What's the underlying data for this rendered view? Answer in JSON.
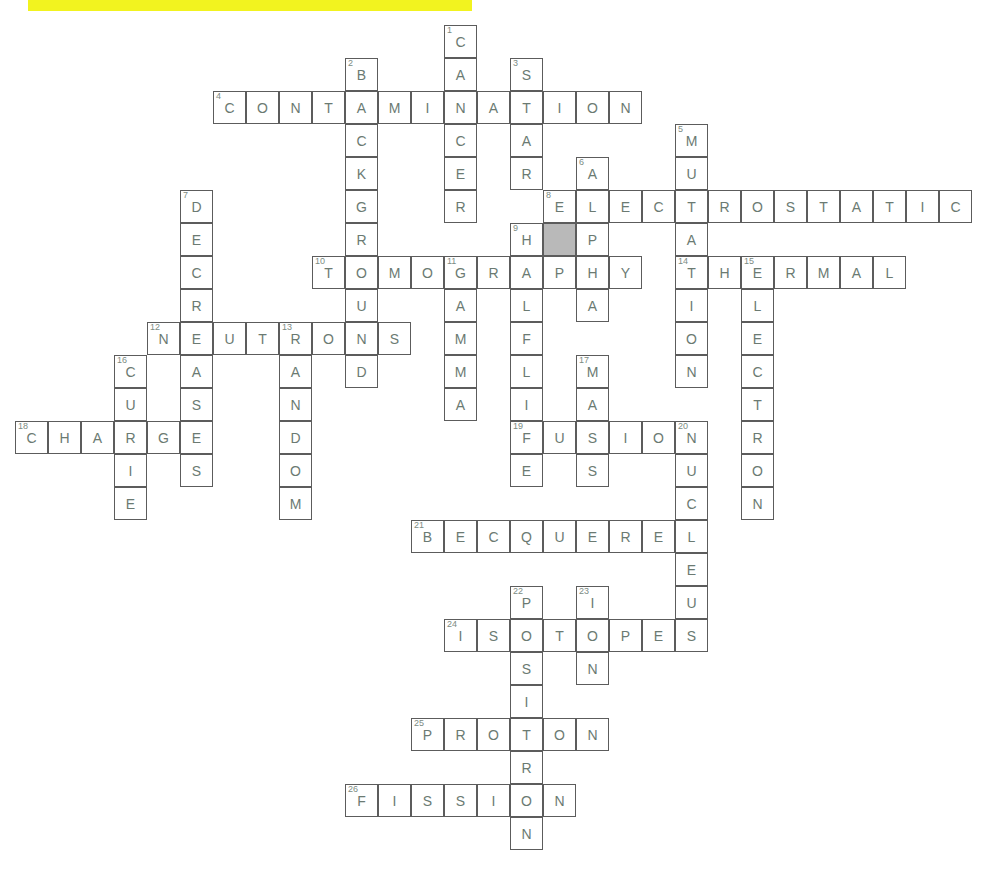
{
  "page": {
    "width": 984,
    "height": 882
  },
  "highlight": {
    "name": "yellow-highlight-bar",
    "color": "#f2f31f",
    "x": 28,
    "y": 0,
    "width": 444,
    "height": 11
  },
  "grid": {
    "cell_size": 33,
    "origin_x": 15,
    "origin_y": 25,
    "border_color": "#5c5c5c",
    "letter_color": "#6b7a72",
    "clue_number_color": "#7c8b83",
    "shaded_cell_color": "#b9b9b9",
    "background_color": "#ffffff"
  },
  "chart_data": {
    "type": "table",
    "across_entries": [
      {
        "number": 4,
        "answer": "CONTAMINATION",
        "row": 2,
        "col": 6,
        "length": 13
      },
      {
        "number": 8,
        "answer": "ELECTROSTATIC",
        "row": 5,
        "col": 16,
        "length": 13
      },
      {
        "number": 10,
        "answer": "TOMOGRAPHY",
        "row": 7,
        "col": 9,
        "length": 10
      },
      {
        "number": 14,
        "answer": "THERMAL",
        "row": 7,
        "col": 20,
        "length": 7
      },
      {
        "number": 12,
        "answer": "NEUTRONS",
        "row": 9,
        "col": 4,
        "length": 8
      },
      {
        "number": 18,
        "answer": "CHARGE",
        "row": 12,
        "col": 0,
        "length": 6
      },
      {
        "number": 19,
        "answer": "FUSION",
        "row": 12,
        "col": 15,
        "length": 6
      },
      {
        "number": 21,
        "answer": "BECQUEREL",
        "row": 15,
        "col": 12,
        "length": 9
      },
      {
        "number": 24,
        "answer": "ISOTOPES",
        "row": 18,
        "col": 13,
        "length": 8
      },
      {
        "number": 25,
        "answer": "PROTON",
        "row": 21,
        "col": 12,
        "length": 6
      },
      {
        "number": 26,
        "answer": "FISSION",
        "row": 23,
        "col": 10,
        "length": 7
      }
    ],
    "down_entries": [
      {
        "number": 1,
        "answer": "CANCER",
        "row": 0,
        "col": 13,
        "length": 6
      },
      {
        "number": 2,
        "answer": "BACKGROUND",
        "row": 1,
        "col": 10,
        "length": 10
      },
      {
        "number": 3,
        "answer": "STAR",
        "row": 1,
        "col": 15,
        "length": 4
      },
      {
        "number": 5,
        "answer": "MUTATION",
        "row": 3,
        "col": 20,
        "length": 8
      },
      {
        "number": 6,
        "answer": "ALPHA",
        "row": 4,
        "col": 17,
        "length": 5
      },
      {
        "number": 7,
        "answer": "DECREASES",
        "row": 5,
        "col": 5,
        "length": 9
      },
      {
        "number": 9,
        "answer": "HALFLIFE",
        "row": 6,
        "col": 15,
        "length": 8
      },
      {
        "number": 11,
        "answer": "GAMMA",
        "row": 7,
        "col": 13,
        "length": 5
      },
      {
        "number": 13,
        "answer": "RANDOM",
        "row": 9,
        "col": 8,
        "length": 6
      },
      {
        "number": 15,
        "answer": "ELECTRON",
        "row": 7,
        "col": 22,
        "length": 8
      },
      {
        "number": 16,
        "answer": "CURIE",
        "row": 10,
        "col": 3,
        "length": 5
      },
      {
        "number": 17,
        "answer": "MASS",
        "row": 10,
        "col": 17,
        "length": 4
      },
      {
        "number": 20,
        "answer": "NUCLEUS",
        "row": 12,
        "col": 20,
        "length": 7
      },
      {
        "number": 22,
        "answer": "POSITRON",
        "row": 17,
        "col": 15,
        "length": 8
      },
      {
        "number": 23,
        "answer": "ION",
        "row": 17,
        "col": 17,
        "length": 3
      }
    ],
    "cells": [
      {
        "row": 0,
        "col": 13,
        "letter": "C",
        "num": "1"
      },
      {
        "row": 1,
        "col": 10,
        "letter": "B",
        "num": "2"
      },
      {
        "row": 1,
        "col": 13,
        "letter": "A",
        "num": ""
      },
      {
        "row": 1,
        "col": 15,
        "letter": "S",
        "num": "3"
      },
      {
        "row": 2,
        "col": 6,
        "letter": "C",
        "num": "4"
      },
      {
        "row": 2,
        "col": 7,
        "letter": "O",
        "num": ""
      },
      {
        "row": 2,
        "col": 8,
        "letter": "N",
        "num": ""
      },
      {
        "row": 2,
        "col": 9,
        "letter": "T",
        "num": ""
      },
      {
        "row": 2,
        "col": 10,
        "letter": "A",
        "num": ""
      },
      {
        "row": 2,
        "col": 11,
        "letter": "M",
        "num": ""
      },
      {
        "row": 2,
        "col": 12,
        "letter": "I",
        "num": ""
      },
      {
        "row": 2,
        "col": 13,
        "letter": "N",
        "num": ""
      },
      {
        "row": 2,
        "col": 14,
        "letter": "A",
        "num": ""
      },
      {
        "row": 2,
        "col": 15,
        "letter": "T",
        "num": ""
      },
      {
        "row": 2,
        "col": 16,
        "letter": "I",
        "num": ""
      },
      {
        "row": 2,
        "col": 17,
        "letter": "O",
        "num": ""
      },
      {
        "row": 2,
        "col": 18,
        "letter": "N",
        "num": ""
      },
      {
        "row": 3,
        "col": 10,
        "letter": "C",
        "num": ""
      },
      {
        "row": 3,
        "col": 13,
        "letter": "C",
        "num": ""
      },
      {
        "row": 3,
        "col": 15,
        "letter": "A",
        "num": ""
      },
      {
        "row": 3,
        "col": 20,
        "letter": "M",
        "num": "5"
      },
      {
        "row": 4,
        "col": 10,
        "letter": "K",
        "num": ""
      },
      {
        "row": 4,
        "col": 13,
        "letter": "E",
        "num": ""
      },
      {
        "row": 4,
        "col": 15,
        "letter": "R",
        "num": ""
      },
      {
        "row": 4,
        "col": 17,
        "letter": "A",
        "num": "6"
      },
      {
        "row": 4,
        "col": 20,
        "letter": "U",
        "num": ""
      },
      {
        "row": 5,
        "col": 5,
        "letter": "D",
        "num": "7"
      },
      {
        "row": 5,
        "col": 10,
        "letter": "G",
        "num": ""
      },
      {
        "row": 5,
        "col": 13,
        "letter": "R",
        "num": ""
      },
      {
        "row": 5,
        "col": 16,
        "letter": "E",
        "num": "8"
      },
      {
        "row": 5,
        "col": 17,
        "letter": "L",
        "num": ""
      },
      {
        "row": 5,
        "col": 18,
        "letter": "E",
        "num": ""
      },
      {
        "row": 5,
        "col": 19,
        "letter": "C",
        "num": ""
      },
      {
        "row": 5,
        "col": 20,
        "letter": "T",
        "num": ""
      },
      {
        "row": 5,
        "col": 21,
        "letter": "R",
        "num": ""
      },
      {
        "row": 5,
        "col": 22,
        "letter": "O",
        "num": ""
      },
      {
        "row": 5,
        "col": 23,
        "letter": "S",
        "num": ""
      },
      {
        "row": 5,
        "col": 24,
        "letter": "T",
        "num": ""
      },
      {
        "row": 5,
        "col": 25,
        "letter": "A",
        "num": ""
      },
      {
        "row": 5,
        "col": 26,
        "letter": "T",
        "num": ""
      },
      {
        "row": 5,
        "col": 27,
        "letter": "I",
        "num": ""
      },
      {
        "row": 5,
        "col": 28,
        "letter": "C",
        "num": ""
      },
      {
        "row": 6,
        "col": 5,
        "letter": "E",
        "num": ""
      },
      {
        "row": 6,
        "col": 10,
        "letter": "R",
        "num": ""
      },
      {
        "row": 6,
        "col": 15,
        "letter": "H",
        "num": "9"
      },
      {
        "row": 6,
        "col": 16,
        "letter": "",
        "num": "",
        "shaded": true
      },
      {
        "row": 6,
        "col": 17,
        "letter": "P",
        "num": ""
      },
      {
        "row": 6,
        "col": 20,
        "letter": "A",
        "num": ""
      },
      {
        "row": 7,
        "col": 5,
        "letter": "C",
        "num": ""
      },
      {
        "row": 7,
        "col": 9,
        "letter": "T",
        "num": "10"
      },
      {
        "row": 7,
        "col": 10,
        "letter": "O",
        "num": ""
      },
      {
        "row": 7,
        "col": 11,
        "letter": "M",
        "num": ""
      },
      {
        "row": 7,
        "col": 12,
        "letter": "O",
        "num": ""
      },
      {
        "row": 7,
        "col": 13,
        "letter": "G",
        "num": "11"
      },
      {
        "row": 7,
        "col": 14,
        "letter": "R",
        "num": ""
      },
      {
        "row": 7,
        "col": 15,
        "letter": "A",
        "num": ""
      },
      {
        "row": 7,
        "col": 16,
        "letter": "P",
        "num": ""
      },
      {
        "row": 7,
        "col": 17,
        "letter": "H",
        "num": ""
      },
      {
        "row": 7,
        "col": 18,
        "letter": "Y",
        "num": ""
      },
      {
        "row": 7,
        "col": 20,
        "letter": "T",
        "num": "14"
      },
      {
        "row": 7,
        "col": 21,
        "letter": "H",
        "num": ""
      },
      {
        "row": 7,
        "col": 22,
        "letter": "E",
        "num": "15"
      },
      {
        "row": 7,
        "col": 23,
        "letter": "R",
        "num": ""
      },
      {
        "row": 7,
        "col": 24,
        "letter": "M",
        "num": ""
      },
      {
        "row": 7,
        "col": 25,
        "letter": "A",
        "num": ""
      },
      {
        "row": 7,
        "col": 26,
        "letter": "L",
        "num": ""
      },
      {
        "row": 8,
        "col": 5,
        "letter": "R",
        "num": ""
      },
      {
        "row": 8,
        "col": 10,
        "letter": "U",
        "num": ""
      },
      {
        "row": 8,
        "col": 13,
        "letter": "A",
        "num": ""
      },
      {
        "row": 8,
        "col": 15,
        "letter": "L",
        "num": ""
      },
      {
        "row": 8,
        "col": 17,
        "letter": "A",
        "num": ""
      },
      {
        "row": 8,
        "col": 20,
        "letter": "I",
        "num": ""
      },
      {
        "row": 8,
        "col": 22,
        "letter": "L",
        "num": ""
      },
      {
        "row": 9,
        "col": 4,
        "letter": "N",
        "num": "12"
      },
      {
        "row": 9,
        "col": 5,
        "letter": "E",
        "num": ""
      },
      {
        "row": 9,
        "col": 6,
        "letter": "U",
        "num": ""
      },
      {
        "row": 9,
        "col": 7,
        "letter": "T",
        "num": ""
      },
      {
        "row": 9,
        "col": 8,
        "letter": "R",
        "num": "13"
      },
      {
        "row": 9,
        "col": 9,
        "letter": "O",
        "num": ""
      },
      {
        "row": 9,
        "col": 10,
        "letter": "N",
        "num": ""
      },
      {
        "row": 9,
        "col": 11,
        "letter": "S",
        "num": ""
      },
      {
        "row": 9,
        "col": 13,
        "letter": "M",
        "num": ""
      },
      {
        "row": 9,
        "col": 15,
        "letter": "F",
        "num": ""
      },
      {
        "row": 9,
        "col": 20,
        "letter": "O",
        "num": ""
      },
      {
        "row": 9,
        "col": 22,
        "letter": "E",
        "num": ""
      },
      {
        "row": 10,
        "col": 3,
        "letter": "C",
        "num": "16"
      },
      {
        "row": 10,
        "col": 5,
        "letter": "A",
        "num": ""
      },
      {
        "row": 10,
        "col": 8,
        "letter": "A",
        "num": ""
      },
      {
        "row": 10,
        "col": 10,
        "letter": "D",
        "num": ""
      },
      {
        "row": 10,
        "col": 13,
        "letter": "M",
        "num": ""
      },
      {
        "row": 10,
        "col": 15,
        "letter": "L",
        "num": ""
      },
      {
        "row": 10,
        "col": 17,
        "letter": "M",
        "num": "17"
      },
      {
        "row": 10,
        "col": 20,
        "letter": "N",
        "num": ""
      },
      {
        "row": 10,
        "col": 22,
        "letter": "C",
        "num": ""
      },
      {
        "row": 11,
        "col": 3,
        "letter": "U",
        "num": ""
      },
      {
        "row": 11,
        "col": 5,
        "letter": "S",
        "num": ""
      },
      {
        "row": 11,
        "col": 8,
        "letter": "N",
        "num": ""
      },
      {
        "row": 11,
        "col": 13,
        "letter": "A",
        "num": ""
      },
      {
        "row": 11,
        "col": 15,
        "letter": "I",
        "num": ""
      },
      {
        "row": 11,
        "col": 17,
        "letter": "A",
        "num": ""
      },
      {
        "row": 11,
        "col": 22,
        "letter": "T",
        "num": ""
      },
      {
        "row": 12,
        "col": 0,
        "letter": "C",
        "num": "18"
      },
      {
        "row": 12,
        "col": 1,
        "letter": "H",
        "num": ""
      },
      {
        "row": 12,
        "col": 2,
        "letter": "A",
        "num": ""
      },
      {
        "row": 12,
        "col": 3,
        "letter": "R",
        "num": ""
      },
      {
        "row": 12,
        "col": 4,
        "letter": "G",
        "num": ""
      },
      {
        "row": 12,
        "col": 5,
        "letter": "E",
        "num": ""
      },
      {
        "row": 12,
        "col": 8,
        "letter": "D",
        "num": ""
      },
      {
        "row": 12,
        "col": 15,
        "letter": "F",
        "num": "19"
      },
      {
        "row": 12,
        "col": 16,
        "letter": "U",
        "num": ""
      },
      {
        "row": 12,
        "col": 17,
        "letter": "S",
        "num": ""
      },
      {
        "row": 12,
        "col": 18,
        "letter": "I",
        "num": ""
      },
      {
        "row": 12,
        "col": 19,
        "letter": "O",
        "num": ""
      },
      {
        "row": 12,
        "col": 20,
        "letter": "N",
        "num": "20"
      },
      {
        "row": 12,
        "col": 22,
        "letter": "R",
        "num": ""
      },
      {
        "row": 13,
        "col": 3,
        "letter": "I",
        "num": ""
      },
      {
        "row": 13,
        "col": 5,
        "letter": "S",
        "num": ""
      },
      {
        "row": 13,
        "col": 8,
        "letter": "O",
        "num": ""
      },
      {
        "row": 13,
        "col": 15,
        "letter": "E",
        "num": ""
      },
      {
        "row": 13,
        "col": 17,
        "letter": "S",
        "num": ""
      },
      {
        "row": 13,
        "col": 20,
        "letter": "U",
        "num": ""
      },
      {
        "row": 13,
        "col": 22,
        "letter": "O",
        "num": ""
      },
      {
        "row": 14,
        "col": 3,
        "letter": "E",
        "num": ""
      },
      {
        "row": 14,
        "col": 8,
        "letter": "M",
        "num": ""
      },
      {
        "row": 14,
        "col": 20,
        "letter": "C",
        "num": ""
      },
      {
        "row": 14,
        "col": 22,
        "letter": "N",
        "num": ""
      },
      {
        "row": 15,
        "col": 12,
        "letter": "B",
        "num": "21"
      },
      {
        "row": 15,
        "col": 13,
        "letter": "E",
        "num": ""
      },
      {
        "row": 15,
        "col": 14,
        "letter": "C",
        "num": ""
      },
      {
        "row": 15,
        "col": 15,
        "letter": "Q",
        "num": ""
      },
      {
        "row": 15,
        "col": 16,
        "letter": "U",
        "num": ""
      },
      {
        "row": 15,
        "col": 17,
        "letter": "E",
        "num": ""
      },
      {
        "row": 15,
        "col": 18,
        "letter": "R",
        "num": ""
      },
      {
        "row": 15,
        "col": 19,
        "letter": "E",
        "num": ""
      },
      {
        "row": 15,
        "col": 20,
        "letter": "L",
        "num": ""
      },
      {
        "row": 16,
        "col": 20,
        "letter": "E",
        "num": ""
      },
      {
        "row": 17,
        "col": 15,
        "letter": "P",
        "num": "22"
      },
      {
        "row": 17,
        "col": 17,
        "letter": "I",
        "num": "23"
      },
      {
        "row": 17,
        "col": 20,
        "letter": "U",
        "num": ""
      },
      {
        "row": 18,
        "col": 13,
        "letter": "I",
        "num": "24"
      },
      {
        "row": 18,
        "col": 14,
        "letter": "S",
        "num": ""
      },
      {
        "row": 18,
        "col": 15,
        "letter": "O",
        "num": ""
      },
      {
        "row": 18,
        "col": 16,
        "letter": "T",
        "num": ""
      },
      {
        "row": 18,
        "col": 17,
        "letter": "O",
        "num": ""
      },
      {
        "row": 18,
        "col": 18,
        "letter": "P",
        "num": ""
      },
      {
        "row": 18,
        "col": 19,
        "letter": "E",
        "num": ""
      },
      {
        "row": 18,
        "col": 20,
        "letter": "S",
        "num": ""
      },
      {
        "row": 19,
        "col": 15,
        "letter": "S",
        "num": ""
      },
      {
        "row": 19,
        "col": 17,
        "letter": "N",
        "num": ""
      },
      {
        "row": 20,
        "col": 15,
        "letter": "I",
        "num": ""
      },
      {
        "row": 21,
        "col": 12,
        "letter": "P",
        "num": "25"
      },
      {
        "row": 21,
        "col": 13,
        "letter": "R",
        "num": ""
      },
      {
        "row": 21,
        "col": 14,
        "letter": "O",
        "num": ""
      },
      {
        "row": 21,
        "col": 15,
        "letter": "T",
        "num": ""
      },
      {
        "row": 21,
        "col": 16,
        "letter": "O",
        "num": ""
      },
      {
        "row": 21,
        "col": 17,
        "letter": "N",
        "num": ""
      },
      {
        "row": 22,
        "col": 15,
        "letter": "R",
        "num": ""
      },
      {
        "row": 23,
        "col": 10,
        "letter": "F",
        "num": "26"
      },
      {
        "row": 23,
        "col": 11,
        "letter": "I",
        "num": ""
      },
      {
        "row": 23,
        "col": 12,
        "letter": "S",
        "num": ""
      },
      {
        "row": 23,
        "col": 13,
        "letter": "S",
        "num": ""
      },
      {
        "row": 23,
        "col": 14,
        "letter": "I",
        "num": ""
      },
      {
        "row": 23,
        "col": 15,
        "letter": "O",
        "num": ""
      },
      {
        "row": 23,
        "col": 16,
        "letter": "N",
        "num": ""
      },
      {
        "row": 24,
        "col": 15,
        "letter": "N",
        "num": ""
      }
    ]
  }
}
